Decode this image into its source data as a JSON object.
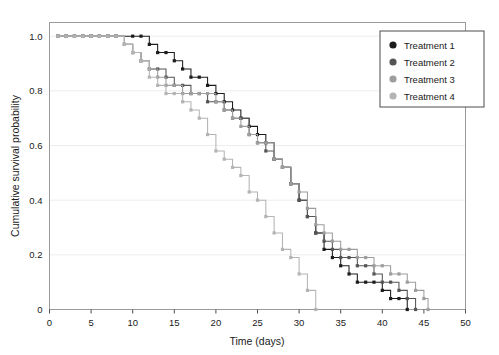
{
  "chart_data": {
    "type": "line",
    "title": "",
    "subtitle": "",
    "xlabel": "Time (days)",
    "ylabel": "Cumulative survival probability",
    "xlim": [
      0,
      50
    ],
    "ylim": [
      0,
      1.05
    ],
    "xticks": [
      0,
      5,
      10,
      15,
      20,
      25,
      30,
      35,
      40,
      45,
      50
    ],
    "xticklabels": [
      "0",
      "5",
      "10",
      "15",
      "20",
      "25",
      "30",
      "35",
      "40",
      "45",
      "50"
    ],
    "yticks": [
      0,
      0.2,
      0.4,
      0.6,
      0.8,
      1.0
    ],
    "yticklabels": [
      "0",
      "0.2",
      "0.4",
      "0.6",
      "0.8",
      "1.0"
    ],
    "grid": "horizontal",
    "legend_position": "top-right",
    "step_style": "post",
    "markers": "square",
    "series": [
      {
        "name": "Treatment 1",
        "color": "#1c1c1c",
        "x": [
          1,
          2,
          3,
          4,
          5,
          6,
          7,
          8,
          10,
          11,
          12,
          13,
          14,
          15,
          16,
          17,
          18,
          19,
          20,
          21,
          22,
          23,
          24,
          25,
          26,
          27,
          28,
          29,
          30,
          31,
          32,
          33,
          34,
          35,
          36,
          37,
          38,
          39,
          40,
          41,
          42,
          43
        ],
        "y": [
          1.0,
          1.0,
          1.0,
          1.0,
          1.0,
          1.0,
          1.0,
          1.0,
          1.0,
          1.0,
          0.97,
          0.94,
          0.94,
          0.91,
          0.88,
          0.85,
          0.85,
          0.82,
          0.79,
          0.76,
          0.73,
          0.7,
          0.67,
          0.64,
          0.61,
          0.55,
          0.52,
          0.46,
          0.4,
          0.34,
          0.28,
          0.22,
          0.19,
          0.16,
          0.13,
          0.1,
          0.1,
          0.1,
          0.07,
          0.04,
          0.04,
          0.0
        ]
      },
      {
        "name": "Treatment 2",
        "color": "#555555",
        "x": [
          1,
          2,
          3,
          4,
          5,
          6,
          7,
          8,
          9,
          10,
          11,
          12,
          13,
          14,
          15,
          16,
          17,
          18,
          19,
          20,
          21,
          22,
          23,
          24,
          25,
          26,
          27,
          28,
          29,
          30,
          31,
          32,
          33,
          34,
          35,
          36,
          37,
          38,
          39,
          40,
          41,
          42,
          43,
          44
        ],
        "y": [
          1.0,
          1.0,
          1.0,
          1.0,
          1.0,
          1.0,
          1.0,
          1.0,
          0.97,
          0.94,
          0.91,
          0.88,
          0.88,
          0.85,
          0.82,
          0.82,
          0.79,
          0.79,
          0.76,
          0.76,
          0.73,
          0.7,
          0.7,
          0.64,
          0.61,
          0.58,
          0.55,
          0.52,
          0.46,
          0.4,
          0.34,
          0.28,
          0.25,
          0.22,
          0.19,
          0.19,
          0.16,
          0.16,
          0.13,
          0.1,
          0.1,
          0.07,
          0.04,
          0.0
        ]
      },
      {
        "name": "Treatment 3",
        "color": "#9d9d9d",
        "x": [
          1,
          2,
          3,
          4,
          5,
          6,
          7,
          8,
          9,
          10,
          11,
          12,
          13,
          14,
          15,
          16,
          17,
          18,
          19,
          20,
          21,
          22,
          23,
          24,
          25,
          26,
          27,
          28,
          29,
          30,
          31,
          32,
          33,
          34,
          35,
          36,
          37,
          38,
          39,
          40,
          41,
          42,
          43,
          44,
          45,
          45.5
        ],
        "y": [
          1.0,
          1.0,
          1.0,
          1.0,
          1.0,
          1.0,
          1.0,
          1.0,
          0.97,
          0.94,
          0.91,
          0.88,
          0.85,
          0.82,
          0.82,
          0.79,
          0.79,
          0.79,
          0.79,
          0.76,
          0.73,
          0.7,
          0.67,
          0.64,
          0.61,
          0.61,
          0.55,
          0.52,
          0.46,
          0.43,
          0.37,
          0.31,
          0.28,
          0.25,
          0.22,
          0.22,
          0.19,
          0.19,
          0.16,
          0.16,
          0.13,
          0.13,
          0.1,
          0.07,
          0.04,
          0.0
        ]
      },
      {
        "name": "Treatment 4",
        "color": "#b4b4b4",
        "x": [
          1,
          2,
          3,
          4,
          5,
          6,
          7,
          8,
          9,
          10,
          11,
          12,
          13,
          14,
          15,
          16,
          17,
          18,
          19,
          20,
          21,
          22,
          23,
          24,
          25,
          26,
          27,
          28,
          29,
          30,
          31,
          32
        ],
        "y": [
          1.0,
          1.0,
          1.0,
          1.0,
          1.0,
          1.0,
          1.0,
          1.0,
          0.97,
          0.94,
          0.91,
          0.85,
          0.82,
          0.79,
          0.79,
          0.76,
          0.73,
          0.7,
          0.64,
          0.58,
          0.55,
          0.52,
          0.49,
          0.43,
          0.4,
          0.34,
          0.28,
          0.22,
          0.19,
          0.13,
          0.07,
          0.0
        ]
      }
    ]
  },
  "legend": {
    "items": [
      {
        "label": "Treatment 1",
        "color": "#1c1c1c"
      },
      {
        "label": "Treatment 2",
        "color": "#555555"
      },
      {
        "label": "Treatment 3",
        "color": "#9d9d9d"
      },
      {
        "label": "Treatment 4",
        "color": "#b4b4b4"
      }
    ]
  }
}
